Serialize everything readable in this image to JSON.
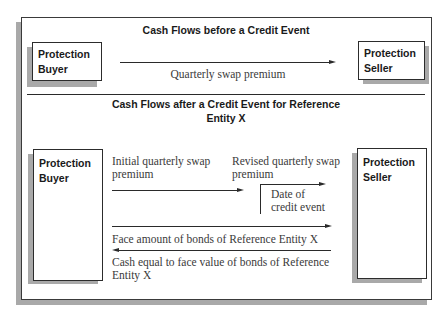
{
  "before": {
    "title": "Cash Flows before a Credit Event",
    "buyer": {
      "line1": "Protection",
      "line2": "Buyer"
    },
    "seller": {
      "line1": "Protection",
      "line2": "Seller"
    },
    "arrow_label": "Quarterly swap premium"
  },
  "after": {
    "title_line1": "Cash Flows after a Credit Event for Reference",
    "title_line2": "Entity X",
    "buyer": {
      "line1": "Protection",
      "line2": "Buyer"
    },
    "seller": {
      "line1": "Protection",
      "line2": "Seller"
    },
    "initial_premium": {
      "line1": "Initial quarterly swap",
      "line2": "premium"
    },
    "revised_premium": {
      "line1": "Revised quarterly swap",
      "line2": "premium"
    },
    "credit_event": {
      "line1": "Date of",
      "line2": "credit event"
    },
    "face_amount_label": "Face amount of bonds of Reference Entity X",
    "cash_label": {
      "line1": "Cash equal to face value of bonds of Reference",
      "line2": "Entity X"
    }
  }
}
